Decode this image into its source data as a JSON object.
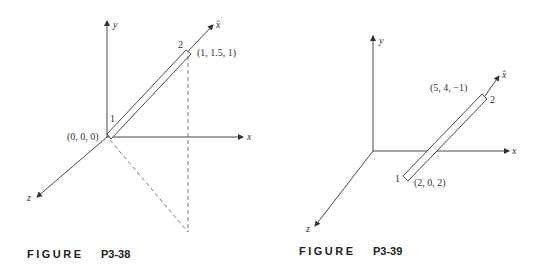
{
  "figures": [
    {
      "id": "P3-38",
      "caption_word": "FIGURE",
      "caption_number": "P3-38",
      "axes": {
        "x": "x",
        "y": "y",
        "z": "z",
        "local": "x̂"
      },
      "node1": {
        "label": "1",
        "coords": "(0, 0, 0)"
      },
      "node2": {
        "label": "2",
        "coords": "(1, 1.5, 1)"
      }
    },
    {
      "id": "P3-39",
      "caption_word": "FIGURE",
      "caption_number": "P3-39",
      "axes": {
        "x": "x",
        "y": "y",
        "z": "z",
        "local": "x̂"
      },
      "node1": {
        "label": "1",
        "coords": "(2, 0, 2)"
      },
      "node2": {
        "label": "2",
        "coords": "(5, 4, −1)"
      }
    }
  ]
}
